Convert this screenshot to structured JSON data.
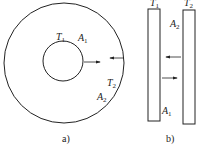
{
  "figure": {
    "panel_a": {
      "caption": "a)",
      "labels": {
        "T1": {
          "main": "T",
          "sub": "1"
        },
        "A1": {
          "main": "A",
          "sub": "1"
        },
        "T2": {
          "main": "T",
          "sub": "2"
        },
        "A2": {
          "main": "A",
          "sub": "2"
        }
      },
      "description": "Concentric circles: inner surface T1/A1, outer surface T2/A2, arrows showing radiation exchange"
    },
    "panel_b": {
      "caption": "b)",
      "labels": {
        "T1": {
          "main": "T",
          "sub": "1"
        },
        "T2": {
          "main": "T",
          "sub": "2"
        },
        "A1": {
          "main": "A",
          "sub": "1"
        },
        "A2": {
          "main": "A",
          "sub": "2"
        }
      },
      "description": "Two parallel plates with arrows showing radiation exchange"
    },
    "colors": {
      "stroke": "#222222",
      "background": "#ffffff"
    }
  }
}
